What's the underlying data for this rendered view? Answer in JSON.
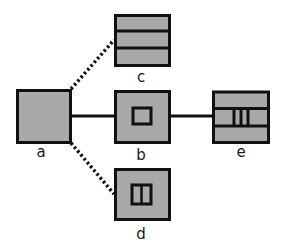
{
  "diagram": {
    "colors": {
      "fill": "#a9a9a9",
      "stroke": "#111111",
      "background": "#ffffff"
    },
    "nodes": [
      {
        "id": "a",
        "label": "a",
        "pattern": "solid"
      },
      {
        "id": "b",
        "label": "b",
        "pattern": "inner-square"
      },
      {
        "id": "c",
        "label": "c",
        "pattern": "three-horizontal-bands"
      },
      {
        "id": "d",
        "label": "d",
        "pattern": "inner-split-rectangle"
      },
      {
        "id": "e",
        "label": "e",
        "pattern": "three-bands-with-vertical-bars"
      }
    ],
    "edges": [
      {
        "from": "a",
        "to": "c",
        "style": "dotted"
      },
      {
        "from": "a",
        "to": "b",
        "style": "solid"
      },
      {
        "from": "a",
        "to": "d",
        "style": "dotted"
      },
      {
        "from": "b",
        "to": "e",
        "style": "solid"
      }
    ],
    "labels": {
      "a": "a",
      "b": "b",
      "c": "c",
      "d": "d",
      "e": "e"
    }
  }
}
